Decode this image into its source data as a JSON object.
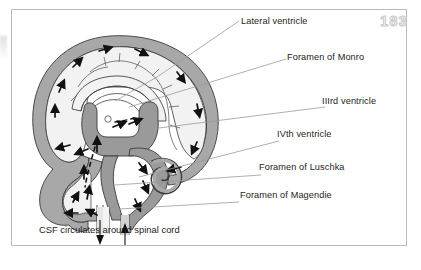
{
  "page": {
    "number": "183"
  },
  "figure": {
    "caption": "CSF circulates around spinal cord"
  },
  "labels": [
    {
      "id": "lateral-ventricle",
      "text": "Lateral ventricle"
    },
    {
      "id": "foramen-of-monro",
      "text": "Foramen of Monro"
    },
    {
      "id": "iiird-ventricle",
      "text": "IIIrd ventricle"
    },
    {
      "id": "ivth-ventricle",
      "text": "IVth ventricle"
    },
    {
      "id": "foramen-of-luschka",
      "text": "Foramen of Luschka"
    },
    {
      "id": "foramen-of-magendie",
      "text": "Foramen of Magendie"
    }
  ],
  "colors": {
    "frame_border": "#b9b9b9",
    "background": "#ffffff",
    "csf_space_fill": "#a8a8a8",
    "ventricle_fill": "#9a9a9a",
    "brain_fill": "#f2f2f2",
    "outline": "#3a3a3a",
    "leader_line": "#9a9a9a",
    "arrow": "#111111",
    "text": "#1d1d1d",
    "page_number": "#d3d3d3"
  },
  "flow_arrows": {
    "description": "Small solid arrowheads indicating direction of cerebrospinal fluid flow",
    "count": 22
  }
}
